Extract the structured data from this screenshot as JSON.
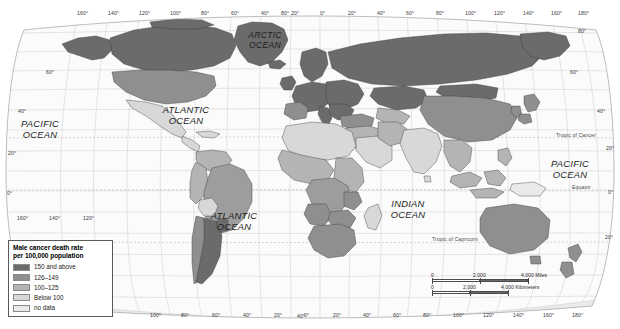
{
  "map": {
    "title": "World map of male cancer death rate",
    "projection": "robinson",
    "ocean_labels": [
      {
        "name": "pacific-ocean-west",
        "line1": "PACIFIC",
        "line2": "OCEAN",
        "x": 40,
        "y": 118,
        "size": "normal"
      },
      {
        "name": "atlantic-ocean-north",
        "line1": "ATLANTIC",
        "line2": "OCEAN",
        "x": 186,
        "y": 104,
        "size": "normal"
      },
      {
        "name": "arctic-ocean",
        "line1": "ARCTIC",
        "line2": "OCEAN",
        "x": 265,
        "y": 30,
        "size": "small"
      },
      {
        "name": "atlantic-ocean-south",
        "line1": "ATLANTIC",
        "line2": "OCEAN",
        "x": 234,
        "y": 210,
        "size": "normal"
      },
      {
        "name": "indian-ocean",
        "line1": "INDIAN",
        "line2": "OCEAN",
        "x": 408,
        "y": 198,
        "size": "normal"
      },
      {
        "name": "pacific-ocean-east",
        "line1": "PACIFIC",
        "line2": "OCEAN",
        "x": 570,
        "y": 158,
        "size": "normal"
      }
    ],
    "reference_lines": [
      {
        "name": "tropic-of-cancer",
        "label": "Tropic of Cancer",
        "y": 138,
        "label_x": 556
      },
      {
        "name": "equator",
        "label": "Equator",
        "y": 190,
        "label_x": 572
      },
      {
        "name": "tropic-of-capricorn",
        "label": "Tropic of Capricorn",
        "y": 242,
        "label_x": 432
      }
    ],
    "longitude_labels_top": [
      {
        "label": "160°",
        "x": 77
      },
      {
        "label": "140°",
        "x": 108
      },
      {
        "label": "120°",
        "x": 139
      },
      {
        "label": "100°",
        "x": 170
      },
      {
        "label": "80°",
        "x": 201
      },
      {
        "label": "60°",
        "x": 231
      },
      {
        "label": "40°",
        "x": 261
      },
      {
        "label": "20°",
        "x": 291
      },
      {
        "label": "0°",
        "x": 320
      },
      {
        "label": "20°",
        "x": 348
      },
      {
        "label": "40°",
        "x": 377
      },
      {
        "label": "60°",
        "x": 406
      },
      {
        "label": "80°",
        "x": 436
      },
      {
        "label": "100°",
        "x": 465
      },
      {
        "label": "120°",
        "x": 494
      },
      {
        "label": "140°",
        "x": 523
      },
      {
        "label": "160°",
        "x": 551
      },
      {
        "label": "180°",
        "x": 578
      }
    ],
    "longitude_labels_bottom": [
      {
        "label": "100°",
        "x": 150
      },
      {
        "label": "80°",
        "x": 181
      },
      {
        "label": "60°",
        "x": 212
      },
      {
        "label": "40°",
        "x": 243
      },
      {
        "label": "20°",
        "x": 274
      },
      {
        "label": "0°",
        "x": 304
      },
      {
        "label": "20°",
        "x": 333
      },
      {
        "label": "40°",
        "x": 363
      },
      {
        "label": "60°",
        "x": 393
      },
      {
        "label": "80°",
        "x": 423
      },
      {
        "label": "100°",
        "x": 453
      },
      {
        "label": "120°",
        "x": 483
      },
      {
        "label": "140°",
        "x": 513
      },
      {
        "label": "160°",
        "x": 543
      },
      {
        "label": "180°",
        "x": 572
      }
    ],
    "longitude_labels_lower_left": [
      {
        "label": "160°",
        "x": 17
      },
      {
        "label": "140°",
        "x": 49
      },
      {
        "label": "120°",
        "x": 83
      }
    ],
    "latitude_labels_left": [
      {
        "label": "60°",
        "x": 46,
        "y": 70
      },
      {
        "label": "40°",
        "x": 18,
        "y": 109
      },
      {
        "label": "20°",
        "x": 8,
        "y": 151
      },
      {
        "label": "0°",
        "x": 7,
        "y": 191
      }
    ],
    "latitude_labels_right": [
      {
        "label": "60°",
        "x": 570,
        "y": 70
      },
      {
        "label": "40°",
        "x": 597,
        "y": 109
      },
      {
        "label": "20°",
        "x": 606,
        "y": 146
      },
      {
        "label": "0°",
        "x": 608,
        "y": 190
      },
      {
        "label": "20°",
        "x": 605,
        "y": 235
      }
    ],
    "latitude_labels_extra": [
      {
        "label": "80°",
        "x": 281,
        "y": 11
      },
      {
        "label": "80°",
        "x": 578,
        "y": 29
      },
      {
        "label": "40°",
        "x": 297,
        "y": 314
      }
    ]
  },
  "legend": {
    "title_line1": "Male cancer death rate",
    "title_line2": "per 100,000 population",
    "items": [
      {
        "label": "150 and above",
        "color": "#6b6b6b"
      },
      {
        "label": "126–149",
        "color": "#8f8f8f"
      },
      {
        "label": "100–125",
        "color": "#b4b4b4"
      },
      {
        "label": "Below 100",
        "color": "#d8d8d8"
      },
      {
        "label": "no data",
        "color": "#eaeaea"
      }
    ]
  },
  "scalebar": {
    "miles": {
      "ticks": [
        "0",
        "2,000",
        "4,000 Miles"
      ],
      "positions": [
        0,
        48,
        96
      ]
    },
    "kilometers": {
      "ticks": [
        "0",
        "2,000",
        "4,000 Kilometers"
      ],
      "positions": [
        0,
        38,
        76
      ]
    }
  },
  "chart_data": {
    "type": "choropleth-map",
    "title": "Male cancer death rate per 100,000 population",
    "unit": "deaths per 100,000 population",
    "classes": [
      {
        "label": "150 and above",
        "min": 150,
        "max": null,
        "color": "#6b6b6b"
      },
      {
        "label": "126-149",
        "min": 126,
        "max": 149,
        "color": "#8f8f8f"
      },
      {
        "label": "100-125",
        "min": 100,
        "max": 125,
        "color": "#b4b4b4"
      },
      {
        "label": "Below 100",
        "min": 0,
        "max": 99,
        "color": "#d8d8d8"
      },
      {
        "label": "no data",
        "min": null,
        "max": null,
        "color": "#eaeaea"
      }
    ],
    "regions": [
      {
        "name": "Canada",
        "class": "150 and above"
      },
      {
        "name": "Greenland",
        "class": "150 and above"
      },
      {
        "name": "United States",
        "class": "126-149"
      },
      {
        "name": "Mexico",
        "class": "Below 100"
      },
      {
        "name": "Russia",
        "class": "150 and above"
      },
      {
        "name": "Europe (western)",
        "class": "150 and above"
      },
      {
        "name": "Europe (central)",
        "class": "150 and above"
      },
      {
        "name": "China",
        "class": "126-149"
      },
      {
        "name": "Mongolia",
        "class": "150 and above"
      },
      {
        "name": "Kazakhstan",
        "class": "150 and above"
      },
      {
        "name": "Japan",
        "class": "126-149"
      },
      {
        "name": "India",
        "class": "Below 100"
      },
      {
        "name": "Southeast Asia",
        "class": "100-125"
      },
      {
        "name": "North Africa",
        "class": "Below 100"
      },
      {
        "name": "Sub-Saharan Africa",
        "class": "100-125"
      },
      {
        "name": "Southern Africa",
        "class": "126-149"
      },
      {
        "name": "Brazil",
        "class": "100-125"
      },
      {
        "name": "Argentina",
        "class": "150 and above"
      },
      {
        "name": "Uruguay",
        "class": "150 and above"
      },
      {
        "name": "Chile",
        "class": "126-149"
      },
      {
        "name": "Peru",
        "class": "100-125"
      },
      {
        "name": "Bolivia",
        "class": "Below 100"
      },
      {
        "name": "Australia",
        "class": "126-149"
      },
      {
        "name": "New Zealand",
        "class": "126-149"
      }
    ],
    "legend_position": "bottom-left",
    "grid": true
  }
}
